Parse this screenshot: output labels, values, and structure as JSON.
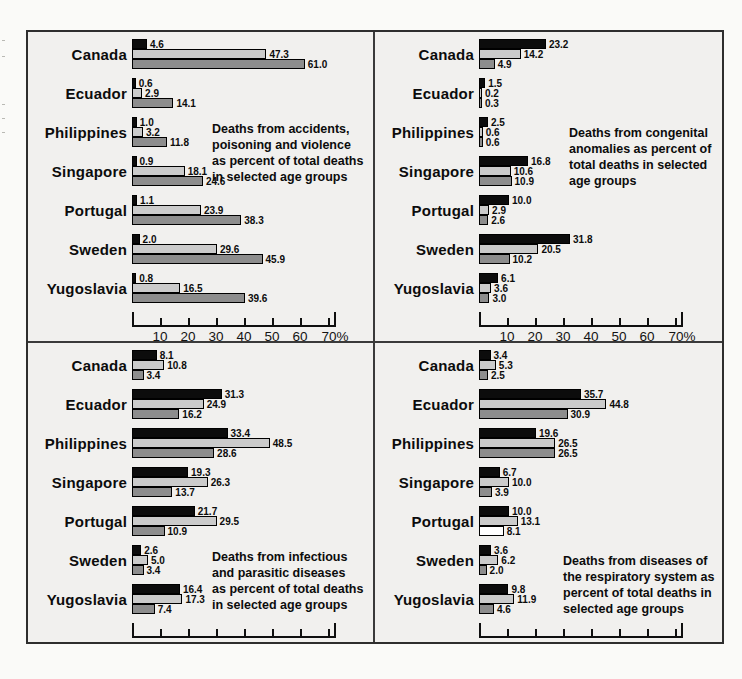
{
  "page": {
    "background_color": "#f1f0ee",
    "border_color": "#2e2e2e",
    "bar_black": "#0c0c0c",
    "bar_light_gray": "#cbcbcb",
    "bar_medium_gray": "#8d8d8d"
  },
  "chart_data": [
    {
      "id": "accidents",
      "type": "bar",
      "orientation": "horizontal",
      "title": "Deaths from accidents, poisoning and violence as percent of total deaths in selected age groups",
      "annotation_lines": [
        "Deaths from accidents,",
        "poisoning and violence",
        "as percent of total deaths",
        "in selected age groups"
      ],
      "annotation_pos": {
        "top": 82,
        "left": 184
      },
      "categories": [
        "Canada",
        "Ecuador",
        "Philippines",
        "Singapore",
        "Portugal",
        "Sweden",
        "Yugoslavia"
      ],
      "series_colors": [
        "#0c0c0c",
        "#cbcbcb",
        "#8d8d8d"
      ],
      "values": [
        [
          4.6,
          47.3,
          61.0
        ],
        [
          0.6,
          2.9,
          14.1
        ],
        [
          1.0,
          3.2,
          11.8
        ],
        [
          0.9,
          18.1,
          24.6
        ],
        [
          1.1,
          23.9,
          38.3
        ],
        [
          2.0,
          29.6,
          45.9
        ],
        [
          0.8,
          16.5,
          39.6
        ]
      ],
      "x_ticks": [
        10,
        20,
        30,
        40,
        50,
        60,
        70
      ],
      "x_tick_labels": [
        "10",
        "20",
        "30",
        "40",
        "50",
        "60",
        "70%"
      ],
      "xlim": [
        0,
        73
      ],
      "grid": false,
      "legend": false
    },
    {
      "id": "congenital",
      "type": "bar",
      "orientation": "horizontal",
      "title": "Deaths from congenital anomalies as percent of total deaths in selected age groups",
      "annotation_lines": [
        "Deaths from congenital",
        "anomalies as percent of",
        "total deaths in selected",
        "age groups"
      ],
      "annotation_pos": {
        "top": 86,
        "left": 194
      },
      "categories": [
        "Canada",
        "Ecuador",
        "Philippines",
        "Singapore",
        "Portugal",
        "Sweden",
        "Yugoslavia"
      ],
      "series_colors": [
        "#0c0c0c",
        "#cbcbcb",
        "#8d8d8d"
      ],
      "values": [
        [
          23.2,
          14.2,
          4.9
        ],
        [
          1.5,
          0.2,
          0.3
        ],
        [
          2.5,
          0.6,
          0.6
        ],
        [
          16.8,
          10.6,
          10.9
        ],
        [
          10.0,
          2.9,
          2.6
        ],
        [
          31.8,
          20.5,
          10.2
        ],
        [
          6.1,
          3.6,
          3.0
        ]
      ],
      "x_ticks": [
        10,
        20,
        30,
        40,
        50,
        60,
        70
      ],
      "x_tick_labels": [
        "10",
        "20",
        "30",
        "40",
        "50",
        "60",
        "70%"
      ],
      "xlim": [
        0,
        73
      ],
      "grid": false,
      "legend": false
    },
    {
      "id": "infectious",
      "type": "bar",
      "orientation": "horizontal",
      "title": "Deaths from infectious and parasitic diseases as percent of total deaths in selected age groups",
      "annotation_lines": [
        "Deaths from infectious",
        "and parasitic diseases",
        "as percent of total deaths",
        "in selected age groups"
      ],
      "annotation_pos": {
        "top": 199,
        "left": 184
      },
      "categories": [
        "Canada",
        "Ecuador",
        "Philippines",
        "Singapore",
        "Portugal",
        "Sweden",
        "Yugoslavia"
      ],
      "series_colors": [
        "#0c0c0c",
        "#cbcbcb",
        "#8d8d8d"
      ],
      "values": [
        [
          8.1,
          10.8,
          3.4
        ],
        [
          31.3,
          24.9,
          16.2
        ],
        [
          33.4,
          48.5,
          28.6
        ],
        [
          19.3,
          26.3,
          13.7
        ],
        [
          21.7,
          29.5,
          10.9
        ],
        [
          2.6,
          5.0,
          3.4
        ],
        [
          16.4,
          17.3,
          7.4
        ]
      ],
      "x_ticks": [
        10,
        20,
        30,
        40,
        50,
        60,
        70
      ],
      "x_tick_labels": [
        "10",
        "20",
        "30",
        "40",
        "50",
        "60",
        "70%"
      ],
      "xlim": [
        0,
        73
      ],
      "grid": false,
      "legend": false
    },
    {
      "id": "respiratory",
      "type": "bar",
      "orientation": "horizontal",
      "title": "Deaths from diseases of the respiratory system as percent of total deaths in selected age groups",
      "annotation_lines": [
        "Deaths from diseases of",
        "the respiratory system as",
        "percent of total deaths in",
        "selected age groups"
      ],
      "annotation_pos": {
        "top": 203,
        "left": 188
      },
      "categories": [
        "Canada",
        "Ecuador",
        "Philippines",
        "Singapore",
        "Portugal",
        "Sweden",
        "Yugoslavia"
      ],
      "series_colors": [
        "#0c0c0c",
        "#cbcbcb",
        "#8d8d8d"
      ],
      "values": [
        [
          3.4,
          5.3,
          2.5
        ],
        [
          35.7,
          44.8,
          30.9
        ],
        [
          19.6,
          26.5,
          26.5
        ],
        [
          6.7,
          10.0,
          3.9
        ],
        [
          10.0,
          13.1,
          8.1
        ],
        [
          3.6,
          6.2,
          2.0
        ],
        [
          9.8,
          11.9,
          4.6
        ]
      ],
      "color_overrides": [
        {
          "category": "Portugal",
          "series_index": 2,
          "color": "#ffffff"
        }
      ],
      "x_ticks": [
        10,
        20,
        30,
        40,
        50,
        60,
        70
      ],
      "x_tick_labels": [
        "10",
        "20",
        "30",
        "40",
        "50",
        "60",
        "70%"
      ],
      "xlim": [
        0,
        73
      ],
      "grid": false,
      "legend": false
    }
  ]
}
